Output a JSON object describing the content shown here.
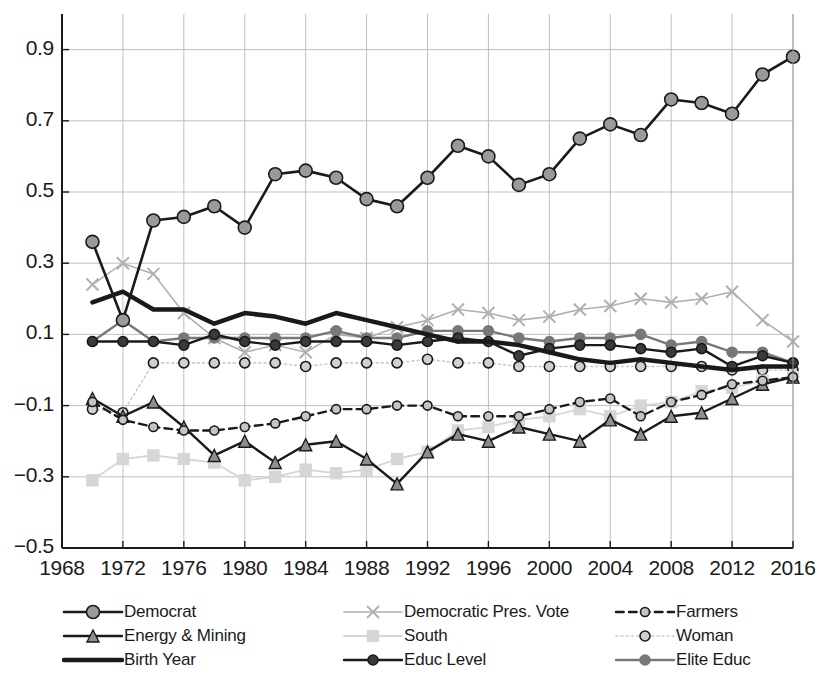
{
  "chart_data": {
    "type": "line",
    "title": "",
    "xlabel": "",
    "ylabel": "",
    "xlim": [
      1968,
      2016
    ],
    "ylim": [
      -0.5,
      1.0
    ],
    "grid": true,
    "legend_position": "bottom",
    "x_tick_labels": [
      "1968",
      "1972",
      "1976",
      "1980",
      "1984",
      "1988",
      "1992",
      "1996",
      "2000",
      "2004",
      "2008",
      "2012",
      "2016"
    ],
    "y_tick_labels": [
      "-0.5",
      "-0.3",
      "-0.1",
      "0.1",
      "0.3",
      "0.5",
      "0.7",
      "0.9"
    ],
    "y_tick_values": [
      -0.5,
      -0.3,
      -0.1,
      0.1,
      0.3,
      0.5,
      0.7,
      0.9
    ],
    "x": [
      1970,
      1972,
      1974,
      1976,
      1978,
      1980,
      1982,
      1984,
      1986,
      1988,
      1990,
      1992,
      1994,
      1996,
      1998,
      2000,
      2002,
      2004,
      2006,
      2008,
      2010,
      2012,
      2014,
      2016
    ],
    "series": [
      {
        "name": "Democrat",
        "marker": "circle",
        "color": "#9a9a9a",
        "line_color": "#1a1a1a",
        "line_style": "solid",
        "line_width": 2.6,
        "marker_size": 13,
        "values": [
          0.36,
          0.14,
          0.42,
          0.43,
          0.46,
          0.4,
          0.55,
          0.56,
          0.54,
          0.48,
          0.46,
          0.54,
          0.63,
          0.6,
          0.52,
          0.55,
          0.65,
          0.69,
          0.66,
          0.76,
          0.75,
          0.72,
          0.83,
          0.88
        ]
      },
      {
        "name": "Democratic Pres. Vote",
        "marker": "x",
        "color": "#b0b0b0",
        "line_color": "#b0b0b0",
        "line_style": "solid",
        "line_width": 1.6,
        "marker_size": 12,
        "values": [
          0.24,
          0.3,
          0.27,
          0.16,
          0.09,
          0.05,
          0.07,
          0.05,
          0.1,
          0.09,
          0.12,
          0.14,
          0.17,
          0.16,
          0.14,
          0.15,
          0.17,
          0.18,
          0.2,
          0.19,
          0.2,
          0.22,
          0.14,
          0.08
        ]
      },
      {
        "name": "Farmers",
        "marker": "circle",
        "color": "#c4c4c4",
        "line_color": "#1a1a1a",
        "line_style": "dashed",
        "line_width": 2.4,
        "marker_size": 9,
        "values": [
          -0.09,
          -0.14,
          -0.16,
          -0.17,
          -0.17,
          -0.16,
          -0.15,
          -0.13,
          -0.11,
          -0.11,
          -0.1,
          -0.1,
          -0.13,
          -0.13,
          -0.13,
          -0.11,
          -0.09,
          -0.08,
          -0.13,
          -0.09,
          -0.07,
          -0.04,
          -0.03,
          -0.02
        ]
      },
      {
        "name": "Energy & Mining",
        "marker": "triangle",
        "color": "#8e8e8e",
        "line_color": "#1a1a1a",
        "line_style": "solid",
        "line_width": 2.4,
        "marker_size": 12,
        "values": [
          -0.08,
          -0.13,
          -0.09,
          -0.16,
          -0.24,
          -0.2,
          -0.26,
          -0.21,
          -0.2,
          -0.25,
          -0.32,
          -0.23,
          -0.18,
          -0.2,
          -0.16,
          -0.18,
          -0.2,
          -0.14,
          -0.18,
          -0.13,
          -0.12,
          -0.08,
          -0.04,
          -0.02
        ]
      },
      {
        "name": "South",
        "marker": "square",
        "color": "#d6d6d6",
        "line_color": "#d6d6d6",
        "line_style": "solid",
        "line_width": 1.8,
        "marker_size": 11,
        "values": [
          -0.31,
          -0.25,
          -0.24,
          -0.25,
          -0.26,
          -0.31,
          -0.3,
          -0.28,
          -0.29,
          -0.28,
          -0.25,
          -0.23,
          -0.17,
          -0.16,
          -0.14,
          -0.13,
          -0.11,
          -0.13,
          -0.1,
          -0.09,
          -0.06,
          -0.05,
          -0.03,
          -0.02
        ]
      },
      {
        "name": "Woman",
        "marker": "circle",
        "color": "#d0d0d0",
        "line_color": "#cccccc",
        "line_style": "dotted",
        "line_width": 1.6,
        "marker_size": 10,
        "values": [
          -0.11,
          -0.12,
          0.02,
          0.02,
          0.02,
          0.02,
          0.02,
          0.01,
          0.02,
          0.02,
          0.02,
          0.03,
          0.02,
          0.02,
          0.01,
          0.01,
          0.01,
          0.01,
          0.01,
          0.01,
          0.01,
          0.0,
          0.0,
          0.0
        ]
      },
      {
        "name": "Birth Year",
        "marker": "none",
        "color": "#1a1a1a",
        "line_color": "#1a1a1a",
        "line_style": "solid",
        "line_width": 4.5,
        "marker_size": 0,
        "values": [
          0.19,
          0.22,
          0.17,
          0.17,
          0.13,
          0.16,
          0.15,
          0.13,
          0.16,
          0.14,
          0.12,
          0.1,
          0.08,
          0.08,
          0.07,
          0.05,
          0.03,
          0.02,
          0.03,
          0.02,
          0.01,
          0.0,
          0.01,
          0.01
        ]
      },
      {
        "name": "Educ Level",
        "marker": "circle",
        "color": "#3a3a3a",
        "line_color": "#1a1a1a",
        "line_style": "solid",
        "line_width": 2.4,
        "marker_size": 10,
        "values": [
          0.08,
          0.08,
          0.08,
          0.07,
          0.1,
          0.08,
          0.07,
          0.08,
          0.08,
          0.08,
          0.07,
          0.08,
          0.09,
          0.08,
          0.04,
          0.06,
          0.07,
          0.07,
          0.06,
          0.05,
          0.06,
          0.01,
          0.04,
          0.02
        ]
      },
      {
        "name": "Elite Educ",
        "marker": "circle",
        "color": "#787878",
        "line_color": "#787878",
        "line_style": "solid",
        "line_width": 2.4,
        "marker_size": 10,
        "values": [
          0.08,
          0.14,
          0.08,
          0.09,
          0.09,
          0.09,
          0.09,
          0.09,
          0.11,
          0.09,
          0.09,
          0.11,
          0.11,
          0.11,
          0.09,
          0.08,
          0.09,
          0.09,
          0.1,
          0.07,
          0.08,
          0.05,
          0.05,
          0.02
        ]
      }
    ]
  },
  "legend": {
    "rows": [
      [
        {
          "label": "Democrat",
          "key": 0
        },
        {
          "label": "Democratic Pres. Vote",
          "key": 1
        },
        {
          "label": "Farmers",
          "key": 2
        }
      ],
      [
        {
          "label": "Energy & Mining",
          "key": 3
        },
        {
          "label": "South",
          "key": 4
        },
        {
          "label": "Woman",
          "key": 5
        }
      ],
      [
        {
          "label": "Birth Year",
          "key": 6
        },
        {
          "label": "Educ Level",
          "key": 7
        },
        {
          "label": "Elite Educ",
          "key": 8
        }
      ]
    ]
  }
}
